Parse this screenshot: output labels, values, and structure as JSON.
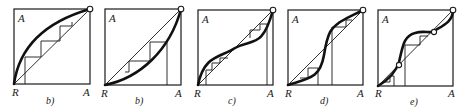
{
  "figure": {
    "panels": [
      {
        "id": "panel-1",
        "caption": "b)",
        "y_axis_label": "A",
        "origin_label": "R",
        "x_axis_label": "A",
        "shape": "concave-above-diagonal"
      },
      {
        "id": "panel-2",
        "caption": "b)",
        "y_axis_label": "A",
        "origin_label": "R",
        "x_axis_label": "A",
        "shape": "convex-below-diagonal"
      },
      {
        "id": "panel-3",
        "caption": "c)",
        "y_axis_label": "A",
        "origin_label": "R",
        "x_axis_label": "A",
        "shape": "s-curve-above-then-below"
      },
      {
        "id": "panel-4",
        "caption": "d)",
        "y_axis_label": "A",
        "origin_label": "R",
        "x_axis_label": "A",
        "shape": "s-curve-below-then-above"
      },
      {
        "id": "panel-5",
        "caption": "e)",
        "y_axis_label": "A",
        "origin_label": "R",
        "x_axis_label": "A",
        "shape": "multiple-crossings"
      }
    ]
  }
}
